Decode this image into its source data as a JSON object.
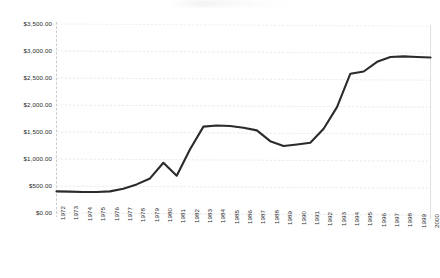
{
  "chart_data": {
    "type": "line",
    "title": "",
    "subtitle": "",
    "xlabel": "",
    "ylabel": "",
    "grid": true,
    "legend": null,
    "ylim": [
      0,
      3500
    ],
    "ytick_step": 500,
    "ytick_labels": [
      "$3,500.00",
      "$3,000.00",
      "$2,500.00",
      "$2,000.00",
      "$1,500.00",
      "$1,000.00",
      "$500.00",
      "$0.00"
    ],
    "ytick_values": [
      3500,
      3000,
      2500,
      2000,
      1500,
      1000,
      500,
      0
    ],
    "categories": [
      "1972",
      "1973",
      "1974",
      "1975",
      "1976",
      "1977",
      "1978",
      "1979",
      "1980",
      "1981",
      "1982",
      "1983",
      "1984",
      "1985",
      "1986",
      "1987",
      "1988",
      "1989",
      "1990",
      "1991",
      "1992",
      "1993",
      "1994",
      "1995",
      "1996",
      "1997",
      "1998",
      "1999",
      "2000"
    ],
    "series": [
      {
        "name": "Value",
        "color": "#2b2b2b",
        "values": [
          400,
          395,
          390,
          390,
          400,
          450,
          530,
          640,
          930,
          690,
          1180,
          1600,
          1620,
          1610,
          1580,
          1530,
          1330,
          1240,
          1270,
          1300,
          1560,
          1960,
          2580,
          2620,
          2800,
          2890,
          2900,
          2890,
          2880
        ]
      }
    ]
  },
  "axes": {
    "y_axis_name": "dollar-value-axis",
    "x_axis_name": "year-axis"
  }
}
